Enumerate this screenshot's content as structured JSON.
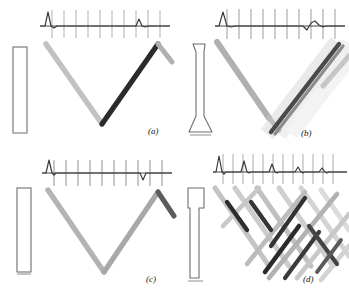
{
  "figure": {
    "panel_count": 4,
    "background_color": "#ffffff",
    "ink_color": "#1a1a1a"
  },
  "palette": {
    "trace_line": "#4a4a4a",
    "tick_light": "#9a9a9a",
    "tick_dark": "#5a5a5a",
    "ray_dark": "#262626",
    "ray_mid": "#8c8c8c",
    "ray_light": "#bdbdbd",
    "ray_faint": "#d8d8d8",
    "specimen_outline": "#6d6d6d"
  },
  "panels": [
    {
      "id": "a",
      "label": "(a)",
      "specimen": {
        "name": "uniform-rectangular-bar",
        "shape": "straight-bar",
        "description": "plain rectangular bar of constant cross-section"
      },
      "ascan": {
        "name": "a-scan-trace-a",
        "tick_count": 11,
        "baseline": "horizontal",
        "pulses": [
          {
            "label": "initial-pulse",
            "position_pct": 6,
            "amplitude": 1.0,
            "polarity": "positive",
            "width": 5
          },
          {
            "label": "back-wall-echo",
            "position_pct": 82,
            "amplitude": 0.34,
            "polarity": "positive",
            "width": 6
          }
        ]
      },
      "rays": {
        "name": "ray-path-v",
        "pattern": "single-v-reflection",
        "strokes": [
          {
            "label": "incident-ray",
            "shade": "ray-light"
          },
          {
            "label": "reflected-ray",
            "shade": "ray-dark"
          },
          {
            "label": "secondary-ray",
            "shade": "ray-mid"
          }
        ]
      }
    },
    {
      "id": "b",
      "label": "(b)",
      "specimen": {
        "name": "flared-foot-bar",
        "shape": "bar-with-flared-base",
        "description": "bar that tapers slightly then flares out at the bottom"
      },
      "ascan": {
        "name": "a-scan-trace-b",
        "tick_count": 11,
        "baseline": "horizontal",
        "pulses": [
          {
            "label": "initial-pulse",
            "position_pct": 6,
            "amplitude": 1.0,
            "polarity": "positive",
            "width": 5
          },
          {
            "label": "dispersed-echo",
            "position_pct": 80,
            "amplitude": 0.18,
            "polarity": "mixed",
            "width": 14
          }
        ]
      },
      "rays": {
        "name": "ray-path-scattered",
        "pattern": "v-reflection-with-scatter",
        "strokes": [
          {
            "label": "incident-ray",
            "shade": "ray-mid"
          },
          {
            "label": "reflected-ray",
            "shade": "ray-dark"
          },
          {
            "label": "scatter-band",
            "shade": "ray-faint"
          }
        ]
      }
    },
    {
      "id": "c",
      "label": "(c)",
      "specimen": {
        "name": "uniform-rectangular-bar",
        "shape": "straight-bar",
        "description": "plain rectangular bar of constant cross-section"
      },
      "ascan": {
        "name": "a-scan-trace-c",
        "tick_count": 11,
        "baseline": "horizontal",
        "pulses": [
          {
            "label": "initial-pulse",
            "position_pct": 6,
            "amplitude": 1.0,
            "polarity": "positive",
            "width": 5
          },
          {
            "label": "inverted-echo",
            "position_pct": 83,
            "amplitude": 0.3,
            "polarity": "negative",
            "width": 6
          }
        ]
      },
      "rays": {
        "name": "ray-path-v",
        "pattern": "single-v-reflection",
        "strokes": [
          {
            "label": "incident-ray",
            "shade": "ray-mid"
          },
          {
            "label": "reflected-ray",
            "shade": "ray-mid"
          },
          {
            "label": "secondary-ray",
            "shade": "ray-dark"
          }
        ]
      }
    },
    {
      "id": "d",
      "label": "(d)",
      "specimen": {
        "name": "stepped-head-bar",
        "shape": "bar-with-wide-head",
        "description": "bar with a wider head section at the top stepping down to a narrow shaft"
      },
      "ascan": {
        "name": "a-scan-trace-d",
        "tick_count": 13,
        "baseline": "horizontal",
        "pulses": [
          {
            "label": "initial-pulse",
            "position_pct": 5,
            "amplitude": 1.0,
            "polarity": "positive",
            "width": 5
          },
          {
            "label": "echo-1",
            "position_pct": 24,
            "amplitude": 0.55,
            "polarity": "positive",
            "width": 6
          },
          {
            "label": "echo-2",
            "position_pct": 44,
            "amplitude": 0.34,
            "polarity": "positive",
            "width": 6
          },
          {
            "label": "echo-3",
            "position_pct": 63,
            "amplitude": 0.22,
            "polarity": "positive",
            "width": 6
          },
          {
            "label": "echo-4",
            "position_pct": 81,
            "amplitude": 0.14,
            "polarity": "positive",
            "width": 6
          }
        ]
      },
      "rays": {
        "name": "ray-path-multiple",
        "pattern": "multiple-zigzag-reverberation",
        "strokes": [
          {
            "label": "zigzag-set-dark",
            "shade": "ray-dark"
          },
          {
            "label": "zigzag-set-mid",
            "shade": "ray-mid"
          },
          {
            "label": "zigzag-set-light",
            "shade": "ray-light"
          }
        ]
      }
    }
  ]
}
